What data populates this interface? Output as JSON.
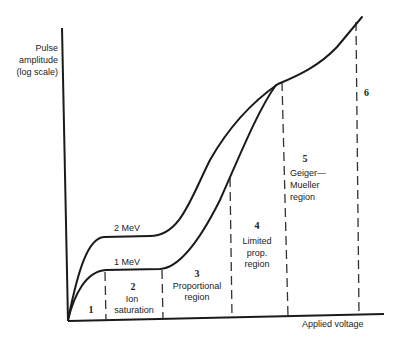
{
  "diagram": {
    "y_axis_label": [
      "Pulse",
      "amplitude",
      "(log scale)"
    ],
    "x_axis_label": "Applied voltage",
    "curves": [
      {
        "label": "2 MeV"
      },
      {
        "label": "1 MeV"
      }
    ],
    "regions": [
      {
        "number": "1",
        "name": []
      },
      {
        "number": "2",
        "name": [
          "Ion",
          "saturation"
        ]
      },
      {
        "number": "3",
        "name": [
          "Proportional",
          "region"
        ]
      },
      {
        "number": "4",
        "name": [
          "Limited",
          "prop.",
          "region"
        ]
      },
      {
        "number": "5",
        "name": [
          "Geiger—",
          "Mueller",
          "region"
        ]
      },
      {
        "number": "6",
        "name": []
      }
    ],
    "colors": {
      "line": "#1a1a1a",
      "background": "#ffffff"
    }
  }
}
